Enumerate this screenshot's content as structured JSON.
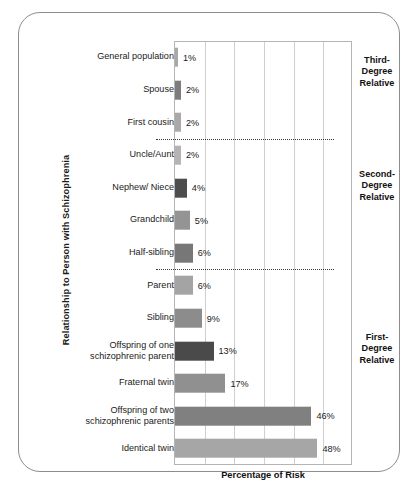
{
  "chart_data": {
    "type": "bar",
    "orientation": "horizontal",
    "title": "",
    "xlabel": "Percentage of Risk",
    "ylabel": "Relationship to Person with Schizophrenia",
    "xlim": [
      0,
      60
    ],
    "grid": true,
    "gridlines_every": 10,
    "legend": "none",
    "categories": [
      "General population",
      "Spouse",
      "First cousin",
      "Uncle/Aunt",
      "Nephew/ Niece",
      "Grandchild",
      "Half-sibling",
      "Parent",
      "Sibling",
      "Offspring of one\nschizophrenic parent",
      "Fraternal twin",
      "Offspring of two\nschizophrenic parents",
      "Identical twin"
    ],
    "values": [
      1,
      2,
      2,
      2,
      4,
      5,
      6,
      6,
      9,
      13,
      17,
      46,
      48
    ],
    "value_labels": [
      "1%",
      "2%",
      "2%",
      "2%",
      "4%",
      "5%",
      "6%",
      "6%",
      "9%",
      "13%",
      "17%",
      "46%",
      "48%"
    ],
    "bar_colors": [
      "#a8a8a8",
      "#7d7d7d",
      "#a9a9a9",
      "#b4b4b4",
      "#4d4d4d",
      "#949494",
      "#777777",
      "#a4a4a4",
      "#8c8c8c",
      "#4a4a4a",
      "#909090",
      "#808080",
      "#a6a6a6"
    ],
    "annotations": [
      {
        "label": "Third-\nDegree\nRelative",
        "covers": [
          0,
          2
        ]
      },
      {
        "label": "Second-\nDegree\nRelative",
        "covers": [
          3,
          6
        ]
      },
      {
        "label": "First-\nDegree\nRelative",
        "covers": [
          7,
          12
        ]
      }
    ],
    "separators_after": [
      "First cousin",
      "Half-sibling"
    ]
  },
  "colors": {
    "border": "#8d8d8d",
    "gridline": "#cfcfcf",
    "axis": "#b5b5b5",
    "text": "#1a1a1a",
    "separator": "#3a3a3a"
  }
}
